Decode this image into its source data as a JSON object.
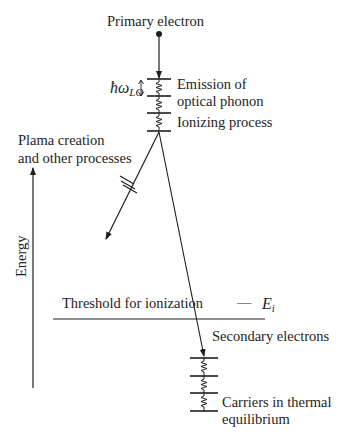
{
  "diagram": {
    "labels": {
      "primary_electron": "Primary electron",
      "phonon_energy": "ħω",
      "phonon_energy_sub": "LO",
      "emission_line1": "Emission of",
      "emission_line2": "optical phonon",
      "ionizing_process": "Ionizing process",
      "plasma_line1": "Plama creation",
      "plasma_line2": "and other processes",
      "energy_axis": "Energy",
      "threshold": "Threshold for ionization",
      "threshold_dash": "—",
      "threshold_symbol": "E",
      "threshold_symbol_sub": "i",
      "secondary_electrons": "Secondary electrons",
      "carriers_line1": "Carriers in thermal",
      "carriers_line2": "equilibrium"
    },
    "colors": {
      "ink": "#1e1e1e",
      "background": "#ffffff"
    }
  }
}
